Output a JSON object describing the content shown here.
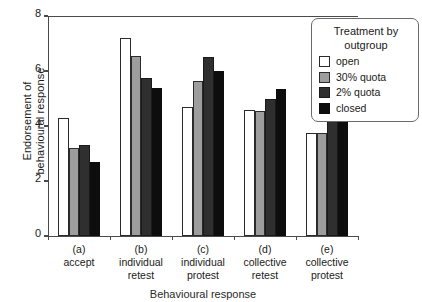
{
  "chart_data": {
    "type": "bar",
    "title": "",
    "xlabel": "Behavioural response",
    "ylabel": "Endorsement of\nbehavioural response",
    "ylim": [
      0,
      8
    ],
    "yticks": [
      0,
      2,
      4,
      6,
      8
    ],
    "grid": false,
    "legend": {
      "position": "top-right",
      "title": "Treatment by\noutgroup",
      "entries": [
        "open",
        "30% quota",
        "2% quota",
        "closed"
      ]
    },
    "categories": [
      {
        "key": "(a)",
        "name": "accept"
      },
      {
        "key": "(b)",
        "name": "individual\nretest"
      },
      {
        "key": "(c)",
        "name": "individual\nprotest"
      },
      {
        "key": "(d)",
        "name": "collective\nretest"
      },
      {
        "key": "(e)",
        "name": "collective\nprotest"
      }
    ],
    "series": [
      {
        "name": "open",
        "color": "#ffffff",
        "values": [
          4.3,
          7.2,
          4.7,
          4.6,
          3.75
        ]
      },
      {
        "name": "30% quota",
        "color": "#9d9d9d",
        "values": [
          3.2,
          6.55,
          5.65,
          4.55,
          3.75
        ]
      },
      {
        "name": "2% quota",
        "color": "#2f2f2f",
        "values": [
          3.3,
          5.75,
          6.5,
          5.0,
          4.7
        ]
      },
      {
        "name": "closed",
        "color": "#0d0d0d",
        "values": [
          2.7,
          5.4,
          6.0,
          5.35,
          6.65
        ]
      }
    ]
  }
}
